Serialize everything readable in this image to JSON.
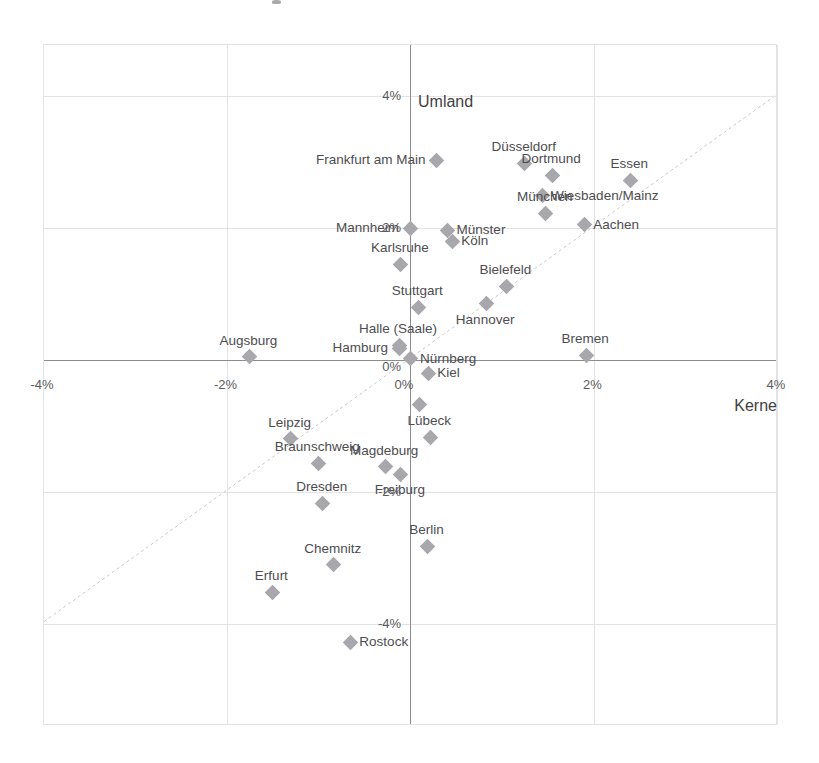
{
  "chart_data": {
    "type": "scatter",
    "title": "",
    "subtitle": "",
    "xlabel": "Kerne",
    "ylabel": "Umland",
    "xlim": [
      -4.4,
      4.0
    ],
    "ylim": [
      -4.75,
      4.0
    ],
    "grid": true,
    "legend": "none",
    "x_ticks": [
      {
        "value": -4,
        "label": "-4%"
      },
      {
        "value": -2,
        "label": "-2%"
      },
      {
        "value": 0,
        "label": "0%"
      },
      {
        "value": 2,
        "label": "2%"
      },
      {
        "value": 4,
        "label": "4%"
      }
    ],
    "y_ticks": [
      {
        "value": 4,
        "label": "4%"
      },
      {
        "value": 2,
        "label": "2%"
      },
      {
        "value": 0,
        "label": "0%"
      },
      {
        "value": -2,
        "label": "-2%"
      },
      {
        "value": -4,
        "label": "-4%"
      }
    ],
    "reference_line": {
      "type": "diagonal",
      "description": "y = x identity line",
      "style": "dashed",
      "color": "#c9c9cd"
    },
    "marker_color": "#a8a8ac",
    "marker_shape": "diamond",
    "points": [
      {
        "label": "Frankfurt am Main",
        "x": 0.29,
        "y": 3.03,
        "label_pos": "left"
      },
      {
        "label": "Düsseldorf",
        "x": 1.25,
        "y": 2.98,
        "label_pos": "above"
      },
      {
        "label": "Dortmund",
        "x": 1.55,
        "y": 2.8,
        "label_pos": "above"
      },
      {
        "label": "Essen",
        "x": 2.4,
        "y": 2.72,
        "label_pos": "above"
      },
      {
        "label": "Wiesbaden/Mainz",
        "x": 1.44,
        "y": 2.49,
        "label_pos": "right"
      },
      {
        "label": "München",
        "x": 1.48,
        "y": 2.22,
        "label_pos": "above"
      },
      {
        "label": "Aachen",
        "x": 1.9,
        "y": 2.05,
        "label_pos": "right"
      },
      {
        "label": "Mannheim",
        "x": 0.0,
        "y": 2.0,
        "label_pos": "left"
      },
      {
        "label": "Münster",
        "x": 0.41,
        "y": 1.97,
        "label_pos": "right"
      },
      {
        "label": "Köln",
        "x": 0.46,
        "y": 1.8,
        "label_pos": "right"
      },
      {
        "label": "Karlsruhe",
        "x": -0.1,
        "y": 1.45,
        "label_pos": "above"
      },
      {
        "label": "Bielefeld",
        "x": 1.05,
        "y": 1.12,
        "label_pos": "above"
      },
      {
        "label": "Hannover",
        "x": 0.83,
        "y": 0.85,
        "label_pos": "below"
      },
      {
        "label": "Stuttgart",
        "x": 0.09,
        "y": 0.8,
        "label_pos": "above"
      },
      {
        "label": "Halle (Saale)",
        "x": -0.12,
        "y": 0.22,
        "label_pos": "above"
      },
      {
        "label": "Hamburg",
        "x": -0.12,
        "y": 0.18,
        "label_pos": "left"
      },
      {
        "label": "Augsburg",
        "x": -1.75,
        "y": 0.05,
        "label_pos": "above"
      },
      {
        "label": "Bremen",
        "x": 1.92,
        "y": 0.07,
        "label_pos": "above"
      },
      {
        "label": "Nürnberg",
        "x": 0.01,
        "y": 0.02,
        "label_pos": "right"
      },
      {
        "label": "Kiel",
        "x": 0.2,
        "y": -0.2,
        "label_pos": "right"
      },
      {
        "label": "",
        "x": 0.1,
        "y": -0.68,
        "label_pos": "none"
      },
      {
        "label": "Lübeck",
        "x": 0.22,
        "y": -1.17,
        "label_pos": "above"
      },
      {
        "label": "Leipzig",
        "x": -1.3,
        "y": -1.19,
        "label_pos": "above"
      },
      {
        "label": "Braunschweig",
        "x": -1.0,
        "y": -1.56,
        "label_pos": "above"
      },
      {
        "label": "Magdeburg",
        "x": -0.27,
        "y": -1.62,
        "label_pos": "above"
      },
      {
        "label": "Freiburg",
        "x": -0.1,
        "y": -1.73,
        "label_pos": "below"
      },
      {
        "label": "Dresden",
        "x": -0.95,
        "y": -2.17,
        "label_pos": "above"
      },
      {
        "label": "Berlin",
        "x": 0.19,
        "y": -2.82,
        "label_pos": "above"
      },
      {
        "label": "Chemnitz",
        "x": -0.83,
        "y": -3.1,
        "label_pos": "above"
      },
      {
        "label": "Erfurt",
        "x": -1.5,
        "y": -3.52,
        "label_pos": "above"
      },
      {
        "label": "Rostock",
        "x": -0.65,
        "y": -4.28,
        "label_pos": "right"
      }
    ]
  }
}
